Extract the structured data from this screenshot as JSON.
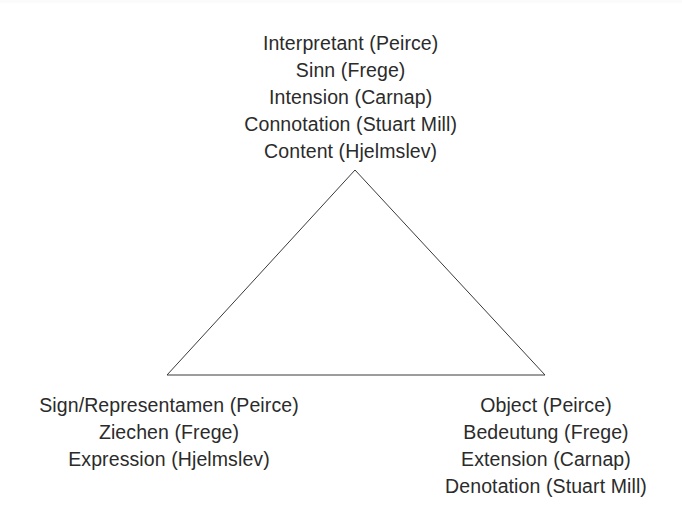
{
  "figure": {
    "background_color": "#ffffff",
    "text_color": "#2b2b2b",
    "line_color": "#3a3a3a"
  },
  "triangle": {
    "apex": {
      "x": 355,
      "y": 170
    },
    "bottom_left": {
      "x": 167,
      "y": 375
    },
    "bottom_right": {
      "x": 545,
      "y": 375
    },
    "stroke_width": 1,
    "stroke_color": "#3a3a3a",
    "fill": "none"
  },
  "vertices": {
    "apex": {
      "name": "interpretant",
      "lines": [
        "Interpretant (Peirce)",
        "Sinn (Frege)",
        "Intension (Carnap)",
        "Connotation (Stuart Mill)",
        "Content (Hjelmslev)"
      ]
    },
    "bottom_left": {
      "name": "sign",
      "lines": [
        "Sign/Representamen (Peirce)",
        "Ziechen (Frege)",
        "Expression (Hjelmslev)"
      ]
    },
    "bottom_right": {
      "name": "object",
      "lines": [
        "Object (Peirce)",
        "Bedeutung (Frege)",
        "Extension (Carnap)",
        "Denotation (Stuart Mill)"
      ]
    }
  }
}
